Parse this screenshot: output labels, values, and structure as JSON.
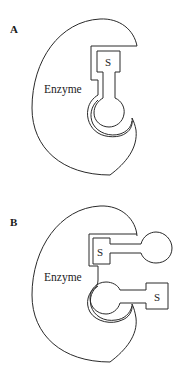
{
  "panels": [
    {
      "label": "A",
      "enzyme_label": "Enzyme",
      "substrate_label": "S",
      "description": "Substrate bound in the enzyme active site"
    },
    {
      "label": "B",
      "enzyme_label": "Enzyme",
      "substrate_labels": [
        "S",
        "S"
      ],
      "description": "Two substrate molecules partially bound"
    }
  ],
  "colors": {
    "stroke": "#2a2a2a",
    "background": "#ffffff"
  }
}
